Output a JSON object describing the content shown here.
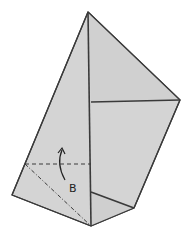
{
  "diagram": {
    "type": "origami-fold-step",
    "label": "B",
    "colors": {
      "paper": "#d4d4d4",
      "paper_shade": "#cbcbcb",
      "edge": "#3a3a3a",
      "background": "#ffffff"
    },
    "annotations": {
      "fold_line_style": "dashed (valley fold)",
      "crease_line_style": "dash-dot (mountain fold)",
      "arrow": "curved fold-up arrow"
    }
  }
}
